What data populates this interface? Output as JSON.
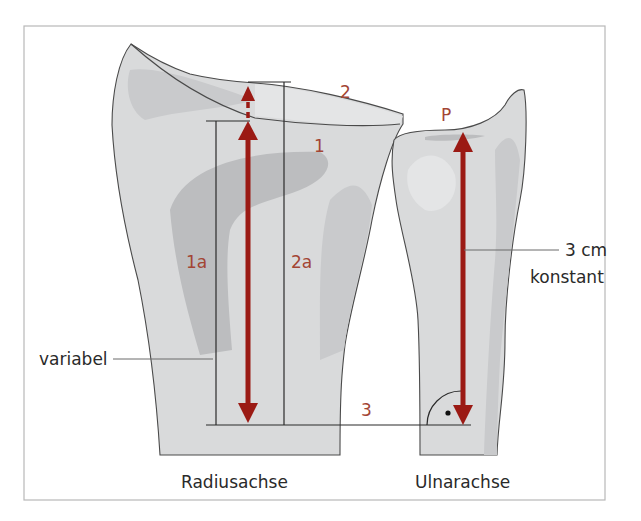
{
  "figure": {
    "bones": {
      "radius_label": "Radiusachse",
      "ulna_label": "Ulnarachse"
    },
    "markers": {
      "line_1": "1",
      "line_2": "2",
      "line_3": "3",
      "dist_1a": "1a",
      "dist_2a": "2a",
      "point_p": "P"
    },
    "annotations": {
      "variable": "variabel",
      "constant_value": "3 cm",
      "constant_text": "konstant"
    },
    "colors": {
      "arrow": "#9b1a14",
      "label_red": "#a34534",
      "bone_fill": "#d9dadb",
      "bone_shadow": "#bcbdbf",
      "frame": "#b8b8b8"
    }
  }
}
